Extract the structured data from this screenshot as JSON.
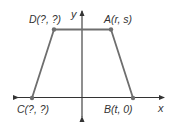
{
  "diagram": {
    "type": "coordinate-trapezoid",
    "axes": {
      "x_label": "x",
      "y_label": "y",
      "color": "#333333"
    },
    "shape": {
      "stroke_color": "#6e6e6e",
      "vertex_color": "#6e6e6e"
    },
    "points": {
      "A": {
        "name": "A",
        "coords": "(r, s)",
        "label": "A(r, s)"
      },
      "B": {
        "name": "B",
        "coords": "(t, 0)",
        "label": "B(t, 0)"
      },
      "C": {
        "name": "C",
        "coords": "(?, ?)",
        "label": "C(?, ?)"
      },
      "D": {
        "name": "D",
        "coords": "(?, ?)",
        "label": "D(?, ?)"
      }
    }
  }
}
